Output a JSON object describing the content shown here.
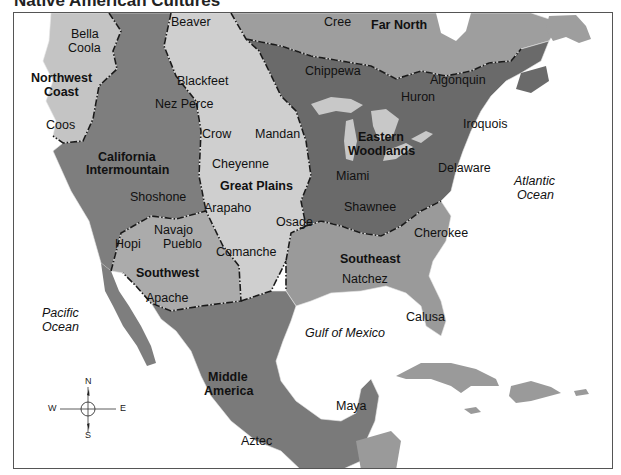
{
  "title": "Native American Cultures",
  "colors": {
    "far_north": "#9e9e9e",
    "northwest_coast": "#c4c4c4",
    "california_intermountain": "#7e7e7e",
    "great_plains": "#cfcfcf",
    "eastern_woodlands": "#6a6a6a",
    "southeast": "#9a9a9a",
    "southwest": "#ababab",
    "middle_america": "#7a7a7a",
    "caribbean": "#9a9a9a",
    "water": "#ffffff",
    "lakes": "#c8c8c8",
    "boundary": "#1a1a1a"
  },
  "regions": [
    {
      "id": "far-north",
      "name": "Far North"
    },
    {
      "id": "northwest-coast",
      "name": "Northwest Coast"
    },
    {
      "id": "california-intermountain",
      "name": "California Intermountain"
    },
    {
      "id": "great-plains",
      "name": "Great Plains"
    },
    {
      "id": "eastern-woodlands",
      "name": "Eastern Woodlands"
    },
    {
      "id": "southeast",
      "name": "Southeast"
    },
    {
      "id": "southwest",
      "name": "Southwest"
    },
    {
      "id": "middle-america",
      "name": "Middle America"
    }
  ],
  "region_labels": {
    "far_north": "Far North",
    "northwest_coast_1": "Northwest",
    "northwest_coast_2": "Coast",
    "california_1": "California",
    "california_2": "Intermountain",
    "great_plains": "Great Plains",
    "eastern_1": "Eastern",
    "eastern_2": "Woodlands",
    "southeast": "Southeast",
    "southwest": "Southwest",
    "middle_1": "Middle",
    "middle_2": "America"
  },
  "tribes": {
    "bella_coola_1": "Bella",
    "bella_coola_2": "Coola",
    "beaver": "Beaver",
    "cree": "Cree",
    "chippewa": "Chippewa",
    "algonquin": "Algonquin",
    "huron": "Huron",
    "iroquois": "Iroquois",
    "blackfeet": "Blackfeet",
    "nez_perce": "Nez Perce",
    "coos": "Coos",
    "crow": "Crow",
    "mandan": "Mandan",
    "cheyenne": "Cheyenne",
    "shoshone": "Shoshone",
    "arapaho": "Arapaho",
    "miami": "Miami",
    "delaware": "Delaware",
    "shawnee": "Shawnee",
    "osage": "Osage",
    "cherokee": "Cherokee",
    "navajo": "Navajo",
    "pueblo": "Pueblo",
    "hopi": "Hopi",
    "comanche": "Comanche",
    "natchez": "Natchez",
    "apache": "Apache",
    "calusa": "Calusa",
    "maya": "Maya",
    "aztec": "Aztec"
  },
  "water_labels": {
    "atlantic_1": "Atlantic",
    "atlantic_2": "Ocean",
    "pacific_1": "Pacific",
    "pacific_2": "Ocean",
    "gulf": "Gulf of Mexico"
  },
  "compass": {
    "n": "N",
    "s": "S",
    "e": "E",
    "w": "W"
  }
}
